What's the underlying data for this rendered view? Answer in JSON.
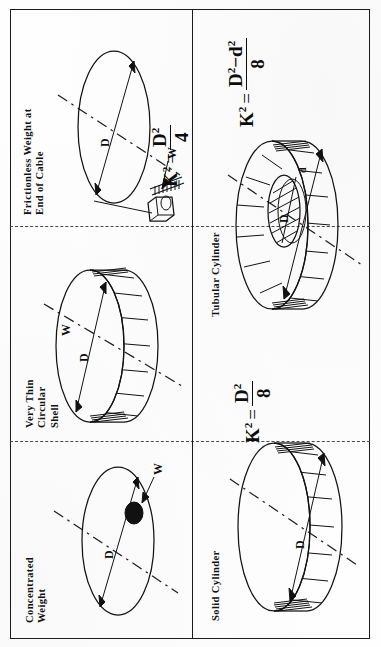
{
  "figure": {
    "orientation": "rotated-90-ccw",
    "kind": "engineering-diagram",
    "panel_count": 4,
    "ink_color": "#121212",
    "paper_color": "#fefefe"
  },
  "panels": [
    {
      "id": "concentrated-weight",
      "title": "Concentrated\nWeight",
      "formula": {
        "lhs": "K",
        "lhs_exp": "2",
        "eq": "=",
        "has_fraction": false,
        "text": ""
      },
      "diameter_label": "D",
      "weight_label": "W",
      "shape": "ellipse-with-point-mass"
    },
    {
      "id": "very-thin-circular-shell",
      "title": "Very Thin\nCircular\nShell",
      "formula": {
        "lhs": "K",
        "lhs_exp": "2",
        "eq": "=",
        "has_fraction": false,
        "text": ""
      },
      "diameter_label": "D",
      "weight_label": "W",
      "shape": "thin-walled-cylinder"
    },
    {
      "id": "frictionless-weight-end-of-cable",
      "title": "Frictionless Weight at\nEnd of Cable",
      "formula": {
        "lhs": "K",
        "lhs_exp": "2",
        "eq": "=",
        "has_fraction": true,
        "numerator": "D",
        "numerator_exp": "2",
        "denominator": "4",
        "text": "K2 = D2/4"
      },
      "diameter_label": "D",
      "weight_label": "W",
      "shape": "ellipse-with-cable-and-block"
    },
    {
      "id": "solid-cylinder",
      "title": "Solid  Cylinder",
      "formula": {
        "lhs": "K",
        "lhs_exp": "2",
        "eq": "=",
        "has_fraction": true,
        "numerator": "D",
        "numerator_exp": "2",
        "denominator": "8",
        "text": "K2 = D2/8"
      },
      "diameter_label": "D",
      "shape": "solid-cylinder"
    },
    {
      "id": "tubular-cylinder",
      "title": "Tubular Cylinder",
      "formula": {
        "lhs": "K",
        "lhs_exp": "2",
        "eq": "=",
        "has_fraction": true,
        "numerator": "D",
        "numerator_exp": "2",
        "numerator_minus": "−",
        "numerator2": "d",
        "numerator2_exp": "2",
        "denominator": "8",
        "text": "K2 = (D2-d2)/8"
      },
      "diameter_label": "D",
      "inner_diameter_label": "d",
      "shape": "tubular-cylinder"
    }
  ],
  "axis_note": "dash-dot line = axis of rotation"
}
